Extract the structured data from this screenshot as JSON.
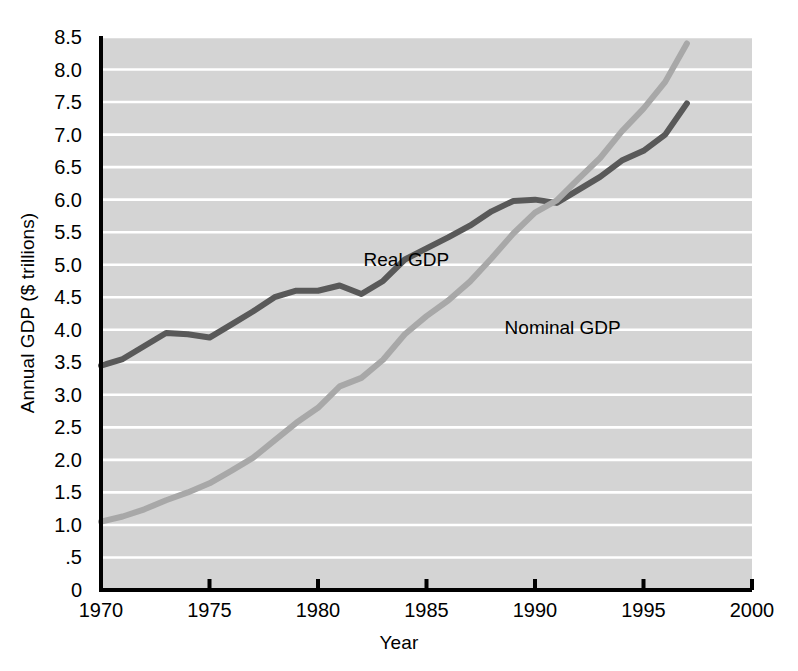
{
  "chart_data": {
    "type": "line",
    "title": "",
    "xlabel": "Year",
    "ylabel": "Annual GDP ($ trillions)",
    "xlim": [
      1970,
      2000
    ],
    "ylim": [
      0,
      8.5
    ],
    "xticks": [
      "1970",
      "1975",
      "1980",
      "1985",
      "1990",
      "1995",
      "2000"
    ],
    "xtick_values": [
      1970,
      1975,
      1980,
      1985,
      1990,
      1995,
      2000
    ],
    "yticks": [
      "0",
      ".5",
      "1.0",
      "1.5",
      "2.0",
      "2.5",
      "3.0",
      "3.5",
      "4.0",
      "4.5",
      "5.0",
      "5.5",
      "6.0",
      "6.5",
      "7.0",
      "7.5",
      "8.0",
      "8.5"
    ],
    "ytick_values": [
      0,
      0.5,
      1.0,
      1.5,
      2.0,
      2.5,
      3.0,
      3.5,
      4.0,
      4.5,
      5.0,
      5.5,
      6.0,
      6.5,
      7.0,
      7.5,
      8.0,
      8.5
    ],
    "grid": "horizontal-white",
    "plot_background": "#d4d4d4",
    "gridline_color": "#ffffff",
    "legend": "inline-annotations",
    "x": [
      1970,
      1971,
      1972,
      1973,
      1974,
      1975,
      1976,
      1977,
      1978,
      1979,
      1980,
      1981,
      1982,
      1983,
      1984,
      1985,
      1986,
      1987,
      1988,
      1989,
      1990,
      1991,
      1992,
      1993,
      1994,
      1995,
      1996,
      1997
    ],
    "series": [
      {
        "name": "Real GDP",
        "color": "#595959",
        "label_x": 1982.1,
        "label_y": 5.08,
        "values": [
          3.45,
          3.55,
          3.75,
          3.95,
          3.93,
          3.88,
          4.08,
          4.28,
          4.5,
          4.6,
          4.6,
          4.68,
          4.55,
          4.75,
          5.08,
          5.25,
          5.42,
          5.6,
          5.82,
          5.98,
          6.0,
          5.95,
          6.15,
          6.35,
          6.6,
          6.75,
          7.0,
          7.48
        ]
      },
      {
        "name": "Nominal GDP",
        "color": "#a8a8a8",
        "label_x": 1988.6,
        "label_y": 4.02,
        "values": [
          1.05,
          1.13,
          1.24,
          1.38,
          1.5,
          1.64,
          1.83,
          2.03,
          2.3,
          2.57,
          2.8,
          3.13,
          3.26,
          3.54,
          3.93,
          4.21,
          4.45,
          4.74,
          5.1,
          5.48,
          5.8,
          5.99,
          6.32,
          6.64,
          7.05,
          7.4,
          7.81,
          8.4
        ]
      }
    ]
  }
}
